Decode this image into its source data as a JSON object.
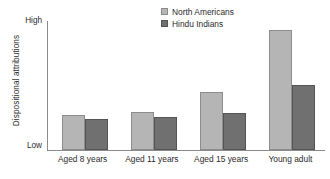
{
  "chart_data": {
    "type": "bar",
    "title": "",
    "subtitle": "",
    "xlabel": "",
    "ylabel": "Dispositional attributions",
    "categories": [
      "Aged 8 years",
      "Aged 11 years",
      "Aged 15 years",
      "Young adult"
    ],
    "series": [
      {
        "name": "North Americans",
        "color": "#b5b5b5",
        "values": [
          27,
          30,
          45,
          94
        ]
      },
      {
        "name": "Hindu Indians",
        "color": "#707070",
        "values": [
          24,
          26,
          29,
          51
        ]
      }
    ],
    "ylim": [
      0,
      100
    ],
    "ytick_labels": [
      "Low",
      "High"
    ],
    "ytick_values": [
      0,
      100
    ],
    "grid": false,
    "legend_position": "top-center",
    "legend_entries": [
      "North Americans",
      "Hindu Indians"
    ]
  },
  "axis": {
    "y_title": "Dispositional attributions",
    "y_top_label": "High",
    "y_bottom_label": "Low"
  }
}
